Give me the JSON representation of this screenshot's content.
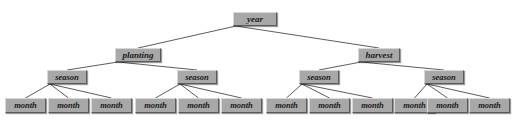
{
  "diagram": {
    "colors": {
      "node_fill": "#a8a8a8",
      "node_border_light": "#d8d8d8",
      "node_border_dark": "#5a5a5a",
      "edge": "#4a4a4a",
      "background": "#ffffff",
      "text": "#1a1a1a"
    },
    "nodes": [
      {
        "id": "year",
        "label": "year",
        "x": 233,
        "y": 12,
        "w": 44,
        "h": 14,
        "level": 0
      },
      {
        "id": "planting",
        "label": "planting",
        "x": 115,
        "y": 48,
        "w": 46,
        "h": 14,
        "level": 1
      },
      {
        "id": "harvest",
        "label": "harvest",
        "x": 358,
        "y": 48,
        "w": 42,
        "h": 14,
        "level": 1
      },
      {
        "id": "season1",
        "label": "season",
        "x": 47,
        "y": 70,
        "w": 40,
        "h": 14,
        "level": 2
      },
      {
        "id": "season2",
        "label": "season",
        "x": 177,
        "y": 70,
        "w": 40,
        "h": 14,
        "level": 2
      },
      {
        "id": "season3",
        "label": "season",
        "x": 299,
        "y": 70,
        "w": 40,
        "h": 14,
        "level": 2
      },
      {
        "id": "season4",
        "label": "season",
        "x": 424,
        "y": 70,
        "w": 40,
        "h": 14,
        "level": 2
      },
      {
        "id": "month1",
        "label": "month",
        "x": 5,
        "y": 98,
        "w": 41,
        "h": 15,
        "level": 3
      },
      {
        "id": "month2",
        "label": "month",
        "x": 48,
        "y": 98,
        "w": 41,
        "h": 15,
        "level": 3
      },
      {
        "id": "month3",
        "label": "month",
        "x": 91,
        "y": 98,
        "w": 41,
        "h": 15,
        "level": 3
      },
      {
        "id": "month4",
        "label": "month",
        "x": 135,
        "y": 98,
        "w": 41,
        "h": 15,
        "level": 3
      },
      {
        "id": "month5",
        "label": "month",
        "x": 178,
        "y": 98,
        "w": 41,
        "h": 15,
        "level": 3
      },
      {
        "id": "month6",
        "label": "month",
        "x": 221,
        "y": 98,
        "w": 41,
        "h": 15,
        "level": 3
      },
      {
        "id": "month7",
        "label": "month",
        "x": 266,
        "y": 98,
        "w": 41,
        "h": 15,
        "level": 3
      },
      {
        "id": "month8",
        "label": "month",
        "x": 309,
        "y": 98,
        "w": 41,
        "h": 15,
        "level": 3
      },
      {
        "id": "month9",
        "label": "month",
        "x": 352,
        "y": 98,
        "w": 41,
        "h": 15,
        "level": 3
      },
      {
        "id": "month10",
        "label": "month",
        "x": 394,
        "y": 98,
        "w": 41,
        "h": 15,
        "level": 3
      },
      {
        "id": "month11",
        "label": "month",
        "x": 427,
        "y": 98,
        "w": 41,
        "h": 15,
        "level": 3
      },
      {
        "id": "month12",
        "label": "month",
        "x": 469,
        "y": 98,
        "w": 41,
        "h": 15,
        "level": 3
      }
    ],
    "edges": [
      {
        "from": "year",
        "to": "planting"
      },
      {
        "from": "year",
        "to": "harvest"
      },
      {
        "from": "planting",
        "to": "season1"
      },
      {
        "from": "planting",
        "to": "season2"
      },
      {
        "from": "harvest",
        "to": "season3"
      },
      {
        "from": "harvest",
        "to": "season4"
      },
      {
        "from": "season1",
        "to": "month1"
      },
      {
        "from": "season1",
        "to": "month2"
      },
      {
        "from": "season1",
        "to": "month3"
      },
      {
        "from": "season2",
        "to": "month4"
      },
      {
        "from": "season2",
        "to": "month5"
      },
      {
        "from": "season2",
        "to": "month6"
      },
      {
        "from": "season3",
        "to": "month7"
      },
      {
        "from": "season3",
        "to": "month8"
      },
      {
        "from": "season3",
        "to": "month9"
      },
      {
        "from": "season4",
        "to": "month10"
      },
      {
        "from": "season4",
        "to": "month11"
      },
      {
        "from": "season4",
        "to": "month12"
      }
    ]
  }
}
